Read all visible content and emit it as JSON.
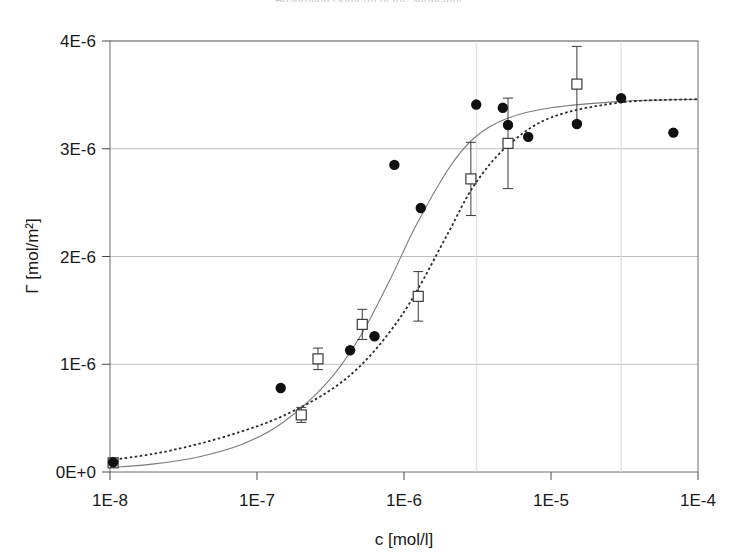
{
  "figure": {
    "clipped_title": "Adsorption isotherm of the surfactant"
  },
  "chart_data": {
    "type": "scatter",
    "title": "",
    "xlabel": "c [mol/l]",
    "ylabel": "Γ [mol/m²]",
    "x_scale": "log",
    "y_scale": "linear",
    "xlim": [
      1e-08,
      0.0001
    ],
    "ylim": [
      0,
      4e-06
    ],
    "xticks": [
      1e-08,
      1e-07,
      1e-06,
      1e-05,
      0.0001
    ],
    "xtick_labels": [
      "1E-8",
      "1E-7",
      "1E-6",
      "1E-5",
      "1E-4"
    ],
    "yticks": [
      0,
      1e-06,
      2e-06,
      3e-06,
      4e-06
    ],
    "ytick_labels": [
      "0E+0",
      "1E-6",
      "2E-6",
      "3E-6",
      "4E-6"
    ],
    "grid": {
      "horizontal": true,
      "vertical": false,
      "color": "#bfbfbf"
    },
    "legend": {
      "visible": false,
      "position": "none"
    },
    "series": [
      {
        "name": "filled-circles",
        "marker": "filled-circle",
        "color": "#101010",
        "points": [
          {
            "x": 1.05e-08,
            "y": 9e-08
          },
          {
            "x": 1.45e-07,
            "y": 7.8e-07
          },
          {
            "x": 4.3e-07,
            "y": 1.13e-06
          },
          {
            "x": 6.3e-07,
            "y": 1.26e-06
          },
          {
            "x": 8.6e-07,
            "y": 2.85e-06
          },
          {
            "x": 1.3e-06,
            "y": 2.45e-06
          },
          {
            "x": 3.1e-06,
            "y": 3.41e-06
          },
          {
            "x": 4.7e-06,
            "y": 3.38e-06
          },
          {
            "x": 5.1e-06,
            "y": 3.22e-06
          },
          {
            "x": 7e-06,
            "y": 3.11e-06
          },
          {
            "x": 1.5e-05,
            "y": 3.23e-06
          },
          {
            "x": 3e-05,
            "y": 3.47e-06
          },
          {
            "x": 6.8e-05,
            "y": 3.15e-06
          }
        ]
      },
      {
        "name": "open-squares",
        "marker": "open-square",
        "color": "#3a3a3a",
        "points": [
          {
            "x": 1.05e-08,
            "y": 8.5e-08,
            "yerr": 4e-08
          },
          {
            "x": 2e-07,
            "y": 5.3e-07,
            "yerr": 7e-08
          },
          {
            "x": 2.6e-07,
            "y": 1.05e-06,
            "yerr": 1e-07
          },
          {
            "x": 5.2e-07,
            "y": 1.37e-06,
            "yerr": 1.4e-07
          },
          {
            "x": 1.25e-06,
            "y": 1.63e-06,
            "yerr": 2.3e-07
          },
          {
            "x": 2.85e-06,
            "y": 2.72e-06,
            "yerr": 3.4e-07
          },
          {
            "x": 5.1e-06,
            "y": 3.05e-06,
            "yerr": 4.2e-07
          },
          {
            "x": 1.5e-05,
            "y": 3.6e-06,
            "yerr": 3.5e-07
          }
        ]
      }
    ],
    "fit_curves": [
      {
        "name": "solid-fit",
        "style": "solid",
        "color": "#7a7a7a",
        "model": "langmuir-sigmoid",
        "gamma_max": 3.46e-06,
        "half_saturation_c": 1.05e-06,
        "points": [
          {
            "x": 1e-08,
            "y": 4e-08
          },
          {
            "x": 2e-08,
            "y": 7.5e-08
          },
          {
            "x": 4e-08,
            "y": 1.4e-07
          },
          {
            "x": 8e-08,
            "y": 2.6e-07
          },
          {
            "x": 1.5e-07,
            "y": 4.6e-07
          },
          {
            "x": 3e-07,
            "y": 8.3e-07
          },
          {
            "x": 5e-07,
            "y": 1.25e-06
          },
          {
            "x": 8e-07,
            "y": 1.78e-06
          },
          {
            "x": 1.2e-06,
            "y": 2.28e-06
          },
          {
            "x": 2e-06,
            "y": 2.81e-06
          },
          {
            "x": 3e-06,
            "y": 3.1e-06
          },
          {
            "x": 5e-06,
            "y": 3.28e-06
          },
          {
            "x": 1e-05,
            "y": 3.38e-06
          },
          {
            "x": 3e-05,
            "y": 3.44e-06
          },
          {
            "x": 0.0001,
            "y": 3.46e-06
          }
        ]
      },
      {
        "name": "dotted-fit",
        "style": "dotted",
        "color": "#2b2b2b",
        "model": "langmuir-sigmoid",
        "gamma_max": 3.47e-06,
        "half_saturation_c": 2.2e-06,
        "points": [
          {
            "x": 1e-08,
            "y": 1.1e-07
          },
          {
            "x": 2e-08,
            "y": 1.7e-07
          },
          {
            "x": 4e-08,
            "y": 2.6e-07
          },
          {
            "x": 8e-08,
            "y": 3.8e-07
          },
          {
            "x": 1.5e-07,
            "y": 5.2e-07
          },
          {
            "x": 3e-07,
            "y": 7.4e-07
          },
          {
            "x": 5e-07,
            "y": 9.8e-07
          },
          {
            "x": 8e-07,
            "y": 1.3e-06
          },
          {
            "x": 1.2e-06,
            "y": 1.66e-06
          },
          {
            "x": 2e-06,
            "y": 2.22e-06
          },
          {
            "x": 3e-06,
            "y": 2.66e-06
          },
          {
            "x": 5e-06,
            "y": 3.02e-06
          },
          {
            "x": 1e-05,
            "y": 3.29e-06
          },
          {
            "x": 3e-05,
            "y": 3.43e-06
          },
          {
            "x": 0.0001,
            "y": 3.46e-06
          }
        ]
      }
    ]
  }
}
